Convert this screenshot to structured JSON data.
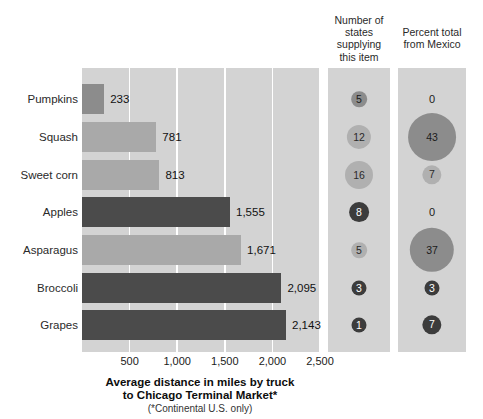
{
  "headers": {
    "states": "Number of\nstates\nsupplying\nthis item",
    "mexico": "Percent total\nfrom Mexico"
  },
  "axis": {
    "title_line1": "Average distance in miles by truck",
    "title_line2": "to Chicago Terminal Market*",
    "note": "(*Continental U.S. only)",
    "ticks": [
      "500",
      "1,000",
      "1,500",
      "2,000",
      "2,500"
    ]
  },
  "colors": {
    "bar_dark": "#4b4b4b",
    "bar_mid": "#8c8c8c",
    "bar_light": "#a9a9a9",
    "panel_bg": "#d3d3d3",
    "gridline": "#ffffff",
    "bubble_dark": "#3c3c3c",
    "bubble_mid": "#8c8c8c",
    "bubble_light": "#b0b0b0"
  },
  "rows": [
    {
      "label": "Pumpkins",
      "distance": 233,
      "distance_label": "233",
      "bar_tone": "mid",
      "states": 5,
      "states_label": "5",
      "states_tone": "b-mid",
      "mexico": 0,
      "mexico_label": "0",
      "mexico_tone": "b-none"
    },
    {
      "label": "Squash",
      "distance": 781,
      "distance_label": "781",
      "bar_tone": "light",
      "states": 12,
      "states_label": "12",
      "states_tone": "b-light",
      "mexico": 43,
      "mexico_label": "43",
      "mexico_tone": "b-mid"
    },
    {
      "label": "Sweet corn",
      "distance": 813,
      "distance_label": "813",
      "bar_tone": "light",
      "states": 16,
      "states_label": "16",
      "states_tone": "b-light",
      "mexico": 7,
      "mexico_label": "7",
      "mexico_tone": "b-light"
    },
    {
      "label": "Apples",
      "distance": 1555,
      "distance_label": "1,555",
      "bar_tone": "dark",
      "states": 8,
      "states_label": "8",
      "states_tone": "b-dark",
      "mexico": 0,
      "mexico_label": "0",
      "mexico_tone": "b-none"
    },
    {
      "label": "Asparagus",
      "distance": 1671,
      "distance_label": "1,671",
      "bar_tone": "light",
      "states": 5,
      "states_label": "5",
      "states_tone": "b-light",
      "mexico": 37,
      "mexico_label": "37",
      "mexico_tone": "b-mid"
    },
    {
      "label": "Broccoli",
      "distance": 2095,
      "distance_label": "2,095",
      "bar_tone": "dark",
      "states": 3,
      "states_label": "3",
      "states_tone": "b-dark",
      "mexico": 3,
      "mexico_label": "3",
      "mexico_tone": "b-dark"
    },
    {
      "label": "Grapes",
      "distance": 2143,
      "distance_label": "2,143",
      "bar_tone": "dark",
      "states": 1,
      "states_label": "1",
      "states_tone": "b-dark",
      "mexico": 7,
      "mexico_label": "7",
      "mexico_tone": "b-dark"
    }
  ],
  "chart_data": {
    "type": "bar",
    "subtitle": "(*Continental U.S. only)",
    "xlabel": "Average distance in miles by truck to Chicago Terminal Market",
    "ylabel": "",
    "xlim": [
      0,
      2500
    ],
    "xticks": [
      500,
      1000,
      1500,
      2000,
      2500
    ],
    "grid": "vertical-white",
    "legend": "none",
    "categories": [
      "Pumpkins",
      "Squash",
      "Sweet corn",
      "Apples",
      "Asparagus",
      "Broccoli",
      "Grapes"
    ],
    "series": [
      {
        "name": "Average distance in miles by truck to Chicago Terminal Market",
        "values": [
          233,
          781,
          813,
          1555,
          1671,
          2095,
          2143
        ],
        "unit": "miles"
      },
      {
        "name": "Number of states supplying this item",
        "values": [
          5,
          12,
          16,
          8,
          5,
          3,
          1
        ],
        "unit": "states",
        "encoding": "bubble-area"
      },
      {
        "name": "Percent total from Mexico",
        "values": [
          0,
          43,
          7,
          0,
          37,
          3,
          7
        ],
        "unit": "percent",
        "encoding": "bubble-area"
      }
    ]
  }
}
